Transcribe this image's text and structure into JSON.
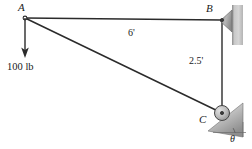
{
  "figure": {
    "background_color": "#ffffff",
    "line_color": "#2b2b2b",
    "wall_color": "#b0b0b0"
  },
  "joints": {
    "a": {
      "label": "A",
      "x": 25,
      "y": 18
    },
    "b": {
      "label": "B",
      "x": 222,
      "y": 20
    },
    "c": {
      "label": "C",
      "x": 222,
      "y": 113
    }
  },
  "members": [
    {
      "name": "member-ab",
      "from": "A",
      "to": "B"
    },
    {
      "name": "member-bc",
      "from": "B",
      "to": "C"
    },
    {
      "name": "member-ac",
      "from": "A",
      "to": "C"
    }
  ],
  "dimensions": {
    "ab_length": "6'",
    "bc_length": "2.5'"
  },
  "load": {
    "magnitude": "100 lb",
    "direction": "down",
    "applied_at": "A"
  },
  "supports": {
    "b": {
      "type": "pin",
      "against": "vertical-wall"
    },
    "c": {
      "type": "roller",
      "on": "inclined-surface"
    }
  },
  "angle": {
    "label": "θ",
    "at": "C",
    "measured_from": "horizontal"
  }
}
